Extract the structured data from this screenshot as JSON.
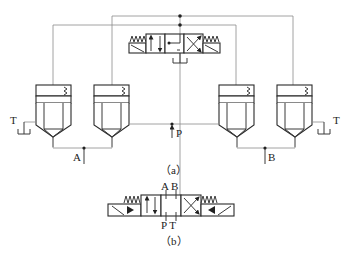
{
  "diagram": {
    "type": "hydraulic-circuit",
    "subfigures": [
      {
        "id": "a",
        "caption": "（a）",
        "description": "Four cartridge valves controlled by a 4/3 directional pilot valve",
        "port_labels": {
          "A": "A",
          "B": "B",
          "P": "P",
          "T_left": "T",
          "T_right": "T"
        },
        "components": [
          "cartridge-valve-1",
          "cartridge-valve-2",
          "cartridge-valve-3",
          "cartridge-valve-4",
          "pilot-directional-valve"
        ]
      },
      {
        "id": "b",
        "caption": "（b）",
        "description": "Equivalent 4/3 solenoid directional valve symbol",
        "port_labels": {
          "A": "A",
          "B": "B",
          "P": "P",
          "T": "T"
        },
        "top_ports": "A B",
        "bottom_ports": "P T"
      }
    ]
  }
}
